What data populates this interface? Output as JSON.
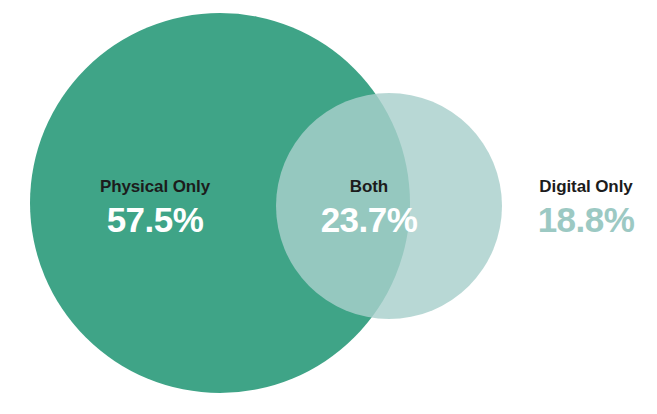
{
  "chart_data": {
    "type": "pie",
    "subtype": "venn",
    "title": "",
    "xlabel": "",
    "ylabel": "",
    "legend_position": "inline-labels",
    "grid": false,
    "unit": "%",
    "categories": [
      "Physical Only",
      "Both",
      "Digital Only"
    ],
    "values": [
      57.5,
      23.7,
      18.8
    ],
    "regions": [
      {
        "key": "physical_only",
        "label": "Physical Only",
        "value": 57.5,
        "value_text": "57.5%",
        "fill": "#3FA487",
        "text_color": "#FFFFFF",
        "label_color": "#1C1C1C"
      },
      {
        "key": "both",
        "label": "Both",
        "value": 23.7,
        "value_text": "23.7%",
        "fill": "#5FAD9A",
        "text_color": "#FFFFFF",
        "label_color": "#1C1C1C"
      },
      {
        "key": "digital_only",
        "label": "Digital Only",
        "value": 18.8,
        "value_text": "18.8%",
        "fill": "#A8D0CC",
        "text_color": "#9CC9C3",
        "label_color": "#1C1C1C"
      }
    ],
    "sets": [
      {
        "key": "physical",
        "name": "Physical",
        "fill": "#3FA487",
        "cx": 220,
        "cy": 203,
        "r": 190
      },
      {
        "key": "digital",
        "name": "Digital",
        "fill": "#A8D0CC",
        "opacity": 0.82,
        "cx": 389,
        "cy": 206,
        "r": 113
      }
    ],
    "background": "#FFFFFF"
  }
}
